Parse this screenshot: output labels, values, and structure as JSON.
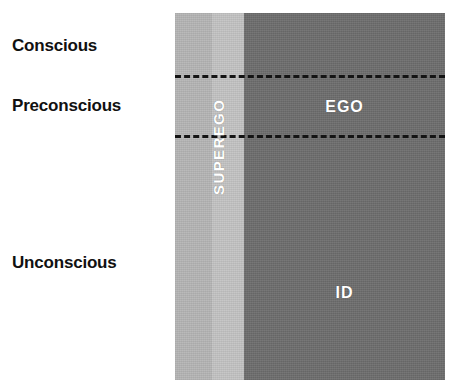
{
  "diagram": {
    "awareness_levels": [
      {
        "id": "conscious",
        "label": "Conscious"
      },
      {
        "id": "preconscious",
        "label": "Preconscious"
      },
      {
        "id": "unconscious",
        "label": "Unconscious"
      }
    ],
    "structures": [
      {
        "id": "superego",
        "label": "SUPEREGO",
        "orientation": "vertical",
        "color": "#b6b6b6"
      },
      {
        "id": "ego",
        "label": "EGO",
        "orientation": "horizontal",
        "color": "#6e6e6e"
      },
      {
        "id": "id",
        "label": "ID",
        "orientation": "horizontal",
        "color": "#6e6e6e"
      }
    ],
    "dividers": [
      {
        "id": "conscious-preconscious",
        "style": "dashed",
        "color": "#141414"
      },
      {
        "id": "preconscious-unconscious",
        "style": "dashed",
        "color": "#141414"
      }
    ],
    "colors": {
      "background": "#ffffff",
      "superego_band": "#b6b6b6",
      "superego_band_light": "#c4c4c4",
      "id_ego_band": "#6e6e6e",
      "label_text": "#111111",
      "structure_text": "#ffffff"
    }
  }
}
